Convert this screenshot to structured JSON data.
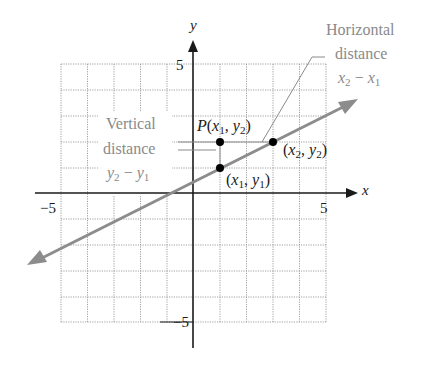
{
  "diagram": {
    "axes": {
      "x_label": "x",
      "y_label": "y",
      "x_ticks": [
        {
          "value": -5,
          "label": "−5"
        },
        {
          "value": 5,
          "label": "5"
        }
      ],
      "y_ticks": [
        {
          "value": 5,
          "label": "5"
        },
        {
          "value": -5,
          "label": "−5"
        }
      ],
      "x_range": [
        -5,
        5
      ],
      "y_range": [
        -5,
        5
      ],
      "grid": true
    },
    "points": [
      {
        "name": "P",
        "label_prefix": "P",
        "label": "(x₁, y₂)",
        "x": 1,
        "y": 2
      },
      {
        "name": "Q",
        "label": "(x₂, y₂)",
        "x": 3,
        "y": 2
      },
      {
        "name": "R",
        "label": "(x₁, y₁)",
        "x": 1,
        "y": 1
      }
    ],
    "line": {
      "through": [
        [
          1,
          1
        ],
        [
          3,
          2
        ]
      ],
      "color": "#8c8c8c"
    },
    "annotations": {
      "vertical": {
        "line1": "Vertical",
        "line2": "distance",
        "expr_a": "y",
        "expr_a_sub": "2",
        "minus": "−",
        "expr_b": "y",
        "expr_b_sub": "1"
      },
      "horizontal": {
        "line1": "Horizontal",
        "line2": "distance",
        "expr_a": "x",
        "expr_a_sub": "2",
        "minus": "−",
        "expr_b": "x",
        "expr_b_sub": "1"
      }
    },
    "labels": {
      "p_prefix": "P",
      "p_open": "(",
      "p_x": "x",
      "p_x_sub": "1",
      "p_comma": ", ",
      "p_y": "y",
      "p_y_sub": "2",
      "p_close": ")",
      "q_open": "(",
      "q_x": "x",
      "q_x_sub": "2",
      "q_comma": ", ",
      "q_y": "y",
      "q_y_sub": "2",
      "q_close": ")",
      "r_open": "(",
      "r_x": "x",
      "r_x_sub": "1",
      "r_comma": ", ",
      "r_y": "y",
      "r_y_sub": "1",
      "r_close": ")"
    },
    "colors": {
      "axis": "#1a1a1a",
      "grid": "#9a9a9a",
      "line": "#8c8c8c",
      "annotation_text": "#8a8a8a",
      "point": "#000000"
    }
  }
}
